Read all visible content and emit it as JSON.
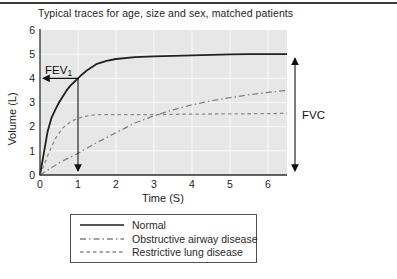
{
  "chart_data": {
    "type": "line",
    "title": "Typical traces for age, size and sex, matched patients",
    "xlabel": "Time (S)",
    "ylabel": "Volume (L)",
    "xlim": [
      0,
      6.5
    ],
    "ylim": [
      0,
      6
    ],
    "xticks": [
      0,
      1,
      2,
      3,
      4,
      5,
      6
    ],
    "yticks": [
      0,
      1,
      2,
      3,
      4,
      5,
      6
    ],
    "grid": true,
    "legend_position": "bottom",
    "colors": {
      "plot_bg": "#e7e7e7",
      "grid": "#fafafa",
      "axis": "#2f2f2f",
      "text": "#1e1e1e",
      "annotation": "#111111",
      "legend_border": "#4f4f4f",
      "top_rule": "#3c3c3c"
    },
    "series": [
      {
        "name": "Normal",
        "line_style": "solid",
        "color": "#212121",
        "width": 1.8,
        "dash": "",
        "x": [
          0,
          0.1,
          0.2,
          0.3,
          0.4,
          0.5,
          0.6,
          0.7,
          0.8,
          0.9,
          1,
          1.1,
          1.25,
          1.5,
          1.75,
          2,
          2.5,
          3,
          3.5,
          4,
          4.5,
          5,
          5.5,
          6,
          6.5
        ],
        "y": [
          0,
          0.9,
          1.8,
          2.35,
          2.7,
          3.0,
          3.25,
          3.5,
          3.7,
          3.85,
          4.0,
          4.15,
          4.35,
          4.6,
          4.72,
          4.8,
          4.88,
          4.91,
          4.93,
          4.95,
          4.97,
          4.99,
          5.0,
          5.0,
          5.0
        ]
      },
      {
        "name": "Obstructive airway disease",
        "line_style": "dash-dot",
        "color": "#828282",
        "width": 1.3,
        "dash": "6,3,1.5,3",
        "x": [
          0,
          0.5,
          1,
          1.5,
          2,
          2.5,
          3,
          3.5,
          4,
          4.5,
          5,
          5.5,
          6,
          6.5
        ],
        "y": [
          0,
          0.5,
          0.9,
          1.35,
          1.75,
          2.15,
          2.45,
          2.7,
          2.9,
          3.07,
          3.2,
          3.32,
          3.42,
          3.5
        ]
      },
      {
        "name": "Restrictive lung disease",
        "line_style": "dashed",
        "color": "#8c8c8c",
        "width": 1.3,
        "dash": "3.5,3",
        "x": [
          0,
          0.2,
          0.4,
          0.6,
          0.8,
          1,
          1.25,
          1.5,
          2,
          2.5,
          3,
          4,
          5,
          6,
          6.5
        ],
        "y": [
          0,
          0.8,
          1.5,
          1.95,
          2.2,
          2.35,
          2.45,
          2.5,
          2.5,
          2.5,
          2.5,
          2.52,
          2.53,
          2.54,
          2.55
        ]
      }
    ],
    "annotations": {
      "fev1": {
        "label": "FEV",
        "label_sub": "1",
        "time": 1,
        "volume": 4
      },
      "fvc": {
        "label": "FVC",
        "from_volume": 5,
        "to_volume": 0
      }
    }
  }
}
